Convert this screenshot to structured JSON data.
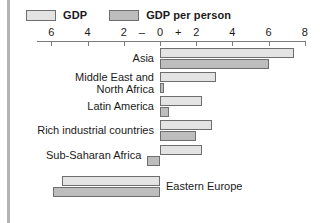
{
  "legend": {
    "entries": [
      {
        "label": "GDP",
        "key": "gdp",
        "color": "#e3e3e3"
      },
      {
        "label": "GDP per person",
        "key": "gdppp",
        "color": "#bdbdbd"
      }
    ]
  },
  "axis": {
    "tick_labels": [
      "6",
      "4",
      "2",
      "0",
      "2",
      "4",
      "6",
      "8"
    ],
    "tick_values": [
      -6,
      -4,
      -2,
      0,
      2,
      4,
      6,
      8
    ],
    "negative_sign": "–",
    "positive_sign": "+",
    "min": -6.8,
    "max": 8
  },
  "chart_data": {
    "type": "bar",
    "orientation": "horizontal",
    "title": "",
    "xlabel": "",
    "ylabel": "",
    "xlim": [
      -6.8,
      8
    ],
    "grid": false,
    "legend_position": "top-left",
    "categories": [
      "Asia",
      "Middle East and\nNorth Africa",
      "Latin America",
      "Rich industrial countries",
      "Sub-Saharan Africa",
      "Eastern Europe"
    ],
    "series": [
      {
        "name": "GDP",
        "color": "#e3e3e3",
        "values": [
          7.4,
          3.1,
          2.3,
          2.9,
          2.3,
          -5.4
        ]
      },
      {
        "name": "GDP per person",
        "color": "#bdbdbd",
        "values": [
          6.0,
          0.2,
          0.5,
          2.0,
          -0.7,
          -5.9
        ]
      }
    ]
  },
  "rows": [
    {
      "label": "Asia",
      "label_side": "left",
      "gdp": 7.4,
      "gdppp": 6.0
    },
    {
      "label": "Middle East and\nNorth Africa",
      "label_side": "left",
      "gdp": 3.1,
      "gdppp": 0.2
    },
    {
      "label": "Latin America",
      "label_side": "left",
      "gdp": 2.3,
      "gdppp": 0.5
    },
    {
      "label": "Rich industrial countries",
      "label_side": "left",
      "gdp": 2.9,
      "gdppp": 2.0
    },
    {
      "label": "Sub-Saharan Africa",
      "label_side": "left",
      "gdp": 2.3,
      "gdppp": -0.7
    },
    {
      "label": "Eastern Europe",
      "label_side": "right",
      "gdp": -5.4,
      "gdppp": -5.9
    }
  ]
}
